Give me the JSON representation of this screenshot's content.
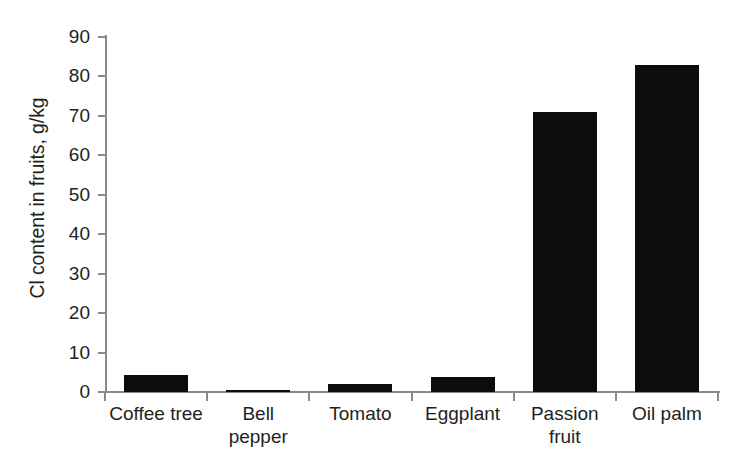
{
  "chart_data": {
    "type": "bar",
    "title": "",
    "xlabel": "",
    "ylabel": "Cl content in fruits, g/kg",
    "categories": [
      "Coffee tree",
      "Bell\npepper",
      "Tomato",
      "Eggplant",
      "Passion\nfruit",
      "Oil palm"
    ],
    "values": [
      4.2,
      0.5,
      2.1,
      3.8,
      71.0,
      83.0
    ],
    "ylim": [
      0,
      90
    ],
    "ytick_labels": [
      "0",
      "10",
      "20",
      "30",
      "40",
      "50",
      "60",
      "70",
      "80",
      "90"
    ],
    "ytick_values": [
      0,
      10,
      20,
      30,
      40,
      50,
      60,
      70,
      80,
      90
    ],
    "grid": false,
    "legend": false,
    "bar_color": "#0c0c0c",
    "axis_color": "#8a8a8a",
    "text_color": "#231f20",
    "background": "#ffffff"
  }
}
